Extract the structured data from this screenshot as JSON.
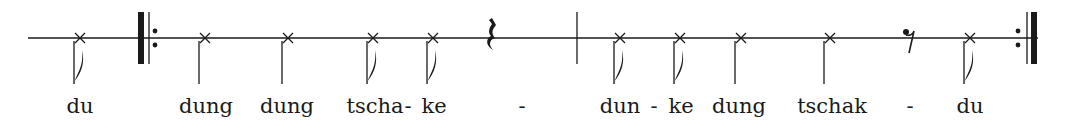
{
  "notation": {
    "line_y": 38,
    "line_start_x": 28,
    "line_end_x": 1038,
    "color": "#1a1a1a",
    "elements": [
      {
        "type": "eighth-note",
        "x": 80
      },
      {
        "type": "repeat-start",
        "x": 141
      },
      {
        "type": "quarter-note",
        "x": 205
      },
      {
        "type": "quarter-note",
        "x": 288
      },
      {
        "type": "eighth-note",
        "x": 373
      },
      {
        "type": "eighth-note",
        "x": 433
      },
      {
        "type": "quarter-rest",
        "x": 490
      },
      {
        "type": "barline",
        "x": 577
      },
      {
        "type": "eighth-note",
        "x": 620
      },
      {
        "type": "eighth-note",
        "x": 680
      },
      {
        "type": "quarter-note",
        "x": 741
      },
      {
        "type": "quarter-note",
        "x": 830
      },
      {
        "type": "eighth-rest",
        "x": 908
      },
      {
        "type": "eighth-note",
        "x": 970
      },
      {
        "type": "repeat-end",
        "x": 1018
      }
    ]
  },
  "lyrics": [
    {
      "text": "du",
      "x": 80
    },
    {
      "text": "dung",
      "x": 206
    },
    {
      "text": "dung",
      "x": 287
    },
    {
      "text": "tscha",
      "x": 375
    },
    {
      "text": "-",
      "x": 408
    },
    {
      "text": "ke",
      "x": 434
    },
    {
      "text": "-",
      "x": 522
    },
    {
      "text": "dun",
      "x": 620
    },
    {
      "text": "-",
      "x": 654
    },
    {
      "text": "ke",
      "x": 681
    },
    {
      "text": "dung",
      "x": 739
    },
    {
      "text": "tschak",
      "x": 832
    },
    {
      "text": "-",
      "x": 910
    },
    {
      "text": "du",
      "x": 970
    }
  ]
}
